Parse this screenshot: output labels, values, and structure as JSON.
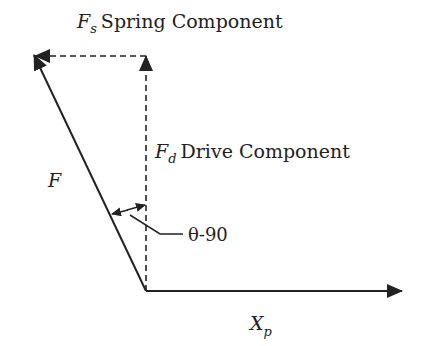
{
  "diagram": {
    "labels": {
      "spring": {
        "symbol": "F",
        "subscript": "s",
        "text": "Spring Component"
      },
      "drive": {
        "symbol": "F",
        "subscript": "d",
        "text": "Drive Component"
      },
      "force": {
        "symbol": "F"
      },
      "angle": {
        "text": "θ-90"
      },
      "axis": {
        "symbol": "X",
        "subscript": "p"
      }
    },
    "colors": {
      "line": "#222222",
      "background": "#ffffff"
    }
  }
}
